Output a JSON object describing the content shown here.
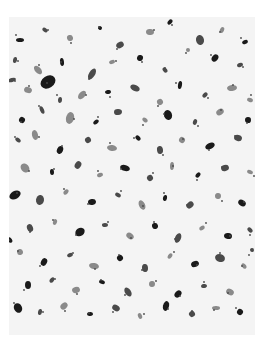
{
  "image": {
    "subject": "micrograph-texture",
    "description": "Grayscale speckle texture of dark irregular particles on a light background",
    "frame": {
      "x": 9,
      "y": 17,
      "width": 246,
      "height": 318
    },
    "colors": {
      "background": "#f4f4f4",
      "particle": "#1a1a1a",
      "particle_mid": "#4a4a4a",
      "particle_light": "#8a8a8a",
      "page": "#ffffff"
    },
    "particles": [
      [
        20,
        40,
        4,
        2
      ],
      [
        45,
        30,
        3,
        2
      ],
      [
        70,
        38,
        3,
        3
      ],
      [
        100,
        28,
        2,
        2
      ],
      [
        120,
        45,
        4,
        3
      ],
      [
        150,
        32,
        4,
        3
      ],
      [
        170,
        22,
        2,
        3
      ],
      [
        200,
        40,
        5,
        4
      ],
      [
        222,
        30,
        3,
        2
      ],
      [
        245,
        42,
        3,
        2
      ],
      [
        15,
        60,
        2,
        3
      ],
      [
        38,
        70,
        5,
        3
      ],
      [
        62,
        62,
        4,
        2
      ],
      [
        92,
        74,
        6,
        3
      ],
      [
        112,
        62,
        3,
        2
      ],
      [
        140,
        58,
        3,
        3
      ],
      [
        165,
        70,
        3,
        2
      ],
      [
        188,
        50,
        2,
        2
      ],
      [
        215,
        58,
        4,
        3
      ],
      [
        240,
        65,
        3,
        2
      ],
      [
        28,
        90,
        4,
        3
      ],
      [
        48,
        82,
        6,
        8
      ],
      [
        60,
        100,
        3,
        2
      ],
      [
        82,
        95,
        5,
        3
      ],
      [
        108,
        92,
        3,
        2
      ],
      [
        135,
        88,
        5,
        3
      ],
      [
        160,
        102,
        3,
        3
      ],
      [
        180,
        85,
        4,
        2
      ],
      [
        205,
        95,
        3,
        2
      ],
      [
        232,
        88,
        5,
        3
      ],
      [
        22,
        120,
        3,
        3
      ],
      [
        42,
        110,
        4,
        2
      ],
      [
        70,
        118,
        6,
        4
      ],
      [
        96,
        122,
        3,
        2
      ],
      [
        118,
        112,
        4,
        3
      ],
      [
        145,
        120,
        3,
        2
      ],
      [
        168,
        115,
        5,
        4
      ],
      [
        195,
        122,
        3,
        2
      ],
      [
        220,
        112,
        4,
        3
      ],
      [
        248,
        120,
        3,
        3
      ],
      [
        18,
        140,
        3,
        2
      ],
      [
        35,
        135,
        5,
        3
      ],
      [
        60,
        150,
        4,
        3
      ],
      [
        88,
        140,
        3,
        3
      ],
      [
        112,
        148,
        5,
        3
      ],
      [
        138,
        138,
        3,
        2
      ],
      [
        160,
        150,
        4,
        3
      ],
      [
        182,
        140,
        3,
        3
      ],
      [
        210,
        146,
        5,
        3
      ],
      [
        238,
        138,
        4,
        3
      ],
      [
        25,
        168,
        5,
        4
      ],
      [
        52,
        172,
        3,
        2
      ],
      [
        78,
        165,
        4,
        3
      ],
      [
        100,
        175,
        3,
        2
      ],
      [
        125,
        168,
        5,
        3
      ],
      [
        150,
        178,
        3,
        3
      ],
      [
        172,
        166,
        4,
        2
      ],
      [
        198,
        175,
        3,
        2
      ],
      [
        225,
        168,
        4,
        3
      ],
      [
        250,
        172,
        3,
        2
      ],
      [
        15,
        195,
        4,
        6
      ],
      [
        40,
        200,
        5,
        4
      ],
      [
        66,
        192,
        3,
        2
      ],
      [
        92,
        202,
        4,
        3
      ],
      [
        118,
        195,
        3,
        2
      ],
      [
        142,
        205,
        5,
        3
      ],
      [
        165,
        198,
        3,
        2
      ],
      [
        190,
        205,
        4,
        3
      ],
      [
        218,
        196,
        3,
        3
      ],
      [
        242,
        203,
        4,
        3
      ],
      [
        30,
        228,
        4,
        3
      ],
      [
        55,
        222,
        3,
        2
      ],
      [
        80,
        232,
        5,
        4
      ],
      [
        105,
        225,
        3,
        2
      ],
      [
        130,
        236,
        4,
        3
      ],
      [
        155,
        226,
        3,
        3
      ],
      [
        178,
        238,
        5,
        3
      ],
      [
        202,
        228,
        3,
        2
      ],
      [
        228,
        236,
        4,
        3
      ],
      [
        250,
        230,
        3,
        2
      ],
      [
        20,
        252,
        3,
        3
      ],
      [
        44,
        262,
        4,
        3
      ],
      [
        70,
        255,
        3,
        2
      ],
      [
        94,
        266,
        5,
        3
      ],
      [
        120,
        258,
        3,
        3
      ],
      [
        145,
        268,
        4,
        3
      ],
      [
        170,
        256,
        3,
        2
      ],
      [
        195,
        264,
        4,
        3
      ],
      [
        220,
        258,
        5,
        4
      ],
      [
        244,
        266,
        3,
        2
      ],
      [
        28,
        285,
        4,
        3
      ],
      [
        52,
        280,
        3,
        2
      ],
      [
        76,
        290,
        4,
        3
      ],
      [
        102,
        282,
        3,
        2
      ],
      [
        128,
        292,
        5,
        3
      ],
      [
        152,
        284,
        3,
        3
      ],
      [
        178,
        294,
        4,
        3
      ],
      [
        204,
        286,
        3,
        2
      ],
      [
        230,
        292,
        4,
        3
      ],
      [
        18,
        308,
        5,
        4
      ],
      [
        40,
        312,
        3,
        2
      ],
      [
        64,
        306,
        4,
        3
      ],
      [
        90,
        314,
        3,
        2
      ],
      [
        116,
        308,
        4,
        3
      ],
      [
        140,
        316,
        3,
        2
      ],
      [
        166,
        306,
        5,
        3
      ],
      [
        192,
        314,
        3,
        3
      ],
      [
        216,
        308,
        4,
        2
      ],
      [
        240,
        312,
        3,
        3
      ],
      [
        12,
        80,
        2,
        4
      ],
      [
        250,
        100,
        2,
        3
      ],
      [
        10,
        240,
        2,
        3
      ],
      [
        252,
        250,
        2,
        2
      ]
    ]
  },
  "caption": {
    "text": ""
  }
}
